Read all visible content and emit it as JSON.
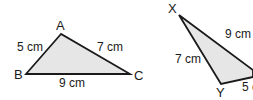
{
  "diagram": {
    "type": "congruent-triangles",
    "fill_color": "#e6e6e6",
    "stroke_color": "#1a1a1a",
    "triangles": [
      {
        "name": "ABC",
        "vertices": [
          {
            "label": "A",
            "x": 61,
            "y": 34
          },
          {
            "label": "B",
            "x": 26,
            "y": 74
          },
          {
            "label": "C",
            "x": 130,
            "y": 74
          }
        ],
        "sides": [
          {
            "between": "AB",
            "label": "5 cm"
          },
          {
            "between": "AC",
            "label": "7 cm"
          },
          {
            "between": "BC",
            "label": "9 cm"
          }
        ]
      },
      {
        "name": "XYZ",
        "vertices": [
          {
            "label": "X",
            "x": 179,
            "y": 15
          },
          {
            "label": "Y",
            "x": 221,
            "y": 84
          }
        ],
        "sides": [
          {
            "between": "XZ",
            "label": "9 cm"
          },
          {
            "between": "XY",
            "label": "7 cm"
          },
          {
            "between": "YZ",
            "label": "5 c"
          }
        ]
      }
    ]
  }
}
